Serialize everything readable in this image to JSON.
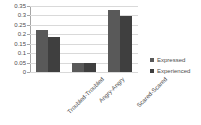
{
  "chart_data": {
    "type": "bar",
    "title": "",
    "xlabel": "",
    "ylabel": "",
    "categories": [
      "Troubled-Troubled",
      "Angry-Angry",
      "Scared-Scared"
    ],
    "series": [
      {
        "name": "Expressed",
        "color": "#595959",
        "values": [
          0.222,
          0.048,
          0.331
        ]
      },
      {
        "name": "Experienced",
        "color": "#3f3f3f",
        "values": [
          0.188,
          0.047,
          0.299
        ]
      }
    ],
    "ylim": [
      0,
      0.35
    ],
    "yticks": [
      "0",
      "0.05",
      "0.1",
      "0.15",
      "0.2",
      "0.25",
      "0.3",
      "0.35"
    ],
    "ytick_values": [
      0,
      0.05,
      0.1,
      0.15,
      0.2,
      0.25,
      0.3,
      0.35
    ],
    "grid": true,
    "legend_position": "right"
  },
  "colors": {
    "background": "#ffffff",
    "gridline": "#d9d9d9",
    "axis": "#a6a6a6",
    "text": "#4d4d4d"
  }
}
